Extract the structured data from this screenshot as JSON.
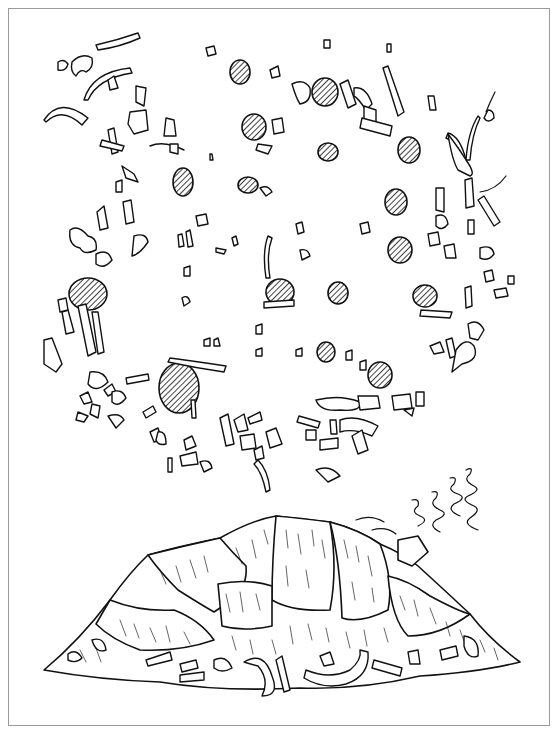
{
  "figure": {
    "text_labels": [],
    "colors": {
      "ink": "#111111",
      "paper": "#ffffff",
      "frame": "#9a9a9a"
    },
    "plan_view": {
      "hatched_features": [
        {
          "cx": 240,
          "cy": 72,
          "rx": 10,
          "ry": 12
        },
        {
          "cx": 325,
          "cy": 92,
          "rx": 13,
          "ry": 14
        },
        {
          "cx": 254,
          "cy": 127,
          "rx": 12,
          "ry": 13
        },
        {
          "cx": 183,
          "cy": 182,
          "rx": 10,
          "ry": 14
        },
        {
          "cx": 248,
          "cy": 185,
          "rx": 10,
          "ry": 8
        },
        {
          "cx": 328,
          "cy": 152,
          "rx": 10,
          "ry": 9
        },
        {
          "cx": 409,
          "cy": 150,
          "rx": 11,
          "ry": 13
        },
        {
          "cx": 396,
          "cy": 202,
          "rx": 11,
          "ry": 13
        },
        {
          "cx": 400,
          "cy": 250,
          "rx": 12,
          "ry": 13
        },
        {
          "cx": 88,
          "cy": 294,
          "rx": 19,
          "ry": 16
        },
        {
          "cx": 280,
          "cy": 292,
          "rx": 14,
          "ry": 13
        },
        {
          "cx": 338,
          "cy": 293,
          "rx": 10,
          "ry": 11
        },
        {
          "cx": 425,
          "cy": 296,
          "rx": 12,
          "ry": 11
        },
        {
          "cx": 326,
          "cy": 352,
          "rx": 9,
          "ry": 10
        },
        {
          "cx": 380,
          "cy": 375,
          "rx": 12,
          "ry": 13
        },
        {
          "cx": 179,
          "cy": 388,
          "rx": 20,
          "ry": 25
        }
      ]
    },
    "elevation_view": {
      "subject": "hide-covered dwelling",
      "smoke": true
    }
  }
}
